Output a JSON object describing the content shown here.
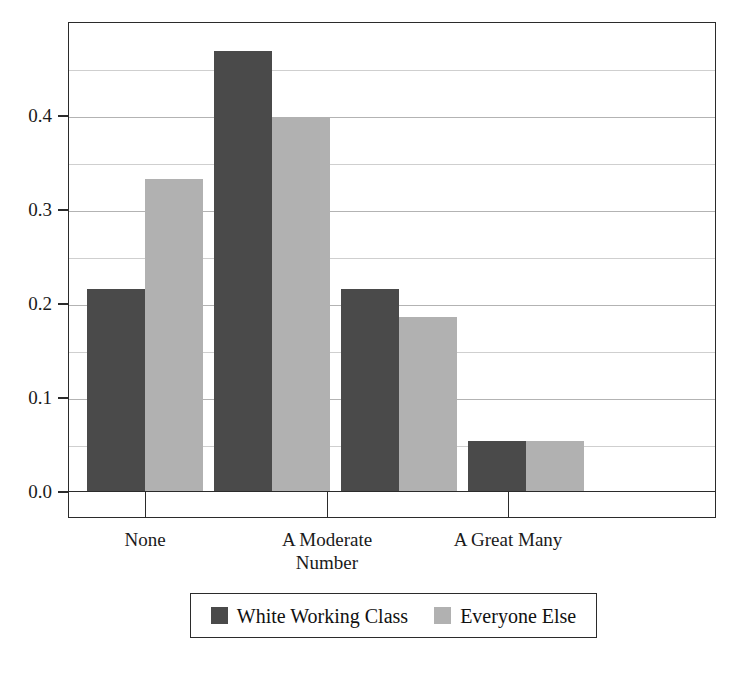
{
  "chart_data": {
    "type": "bar",
    "title": "",
    "subtitle": "",
    "xlabel": "",
    "ylabel": "",
    "categories": [
      "None",
      "",
      "A Moderate\nNumber",
      "A Great Many"
    ],
    "visible_tick_labels": [
      "None",
      "A Moderate\nNumber",
      "A Great Many"
    ],
    "series": [
      {
        "name": "White Working Class",
        "color": "#4a4a4a",
        "values": [
          0.215,
          0.468,
          0.215,
          0.053
        ]
      },
      {
        "name": "Everyone Else",
        "color": "#b1b1b1",
        "values": [
          0.332,
          0.398,
          0.185,
          0.053
        ]
      }
    ],
    "ylim": [
      0.0,
      0.5
    ],
    "yticks": [
      0.0,
      0.1,
      0.2,
      0.3,
      0.4
    ],
    "ytick_labels": [
      "0.0",
      "0.1",
      "0.2",
      "0.3",
      "0.4"
    ],
    "minor_gridlines": [
      0.05,
      0.15,
      0.25,
      0.35,
      0.45
    ],
    "grid": true,
    "grid_axis": "y",
    "legend_position": "bottom",
    "bar_count": 8,
    "bars": [
      {
        "group": "None",
        "series": "White Working Class",
        "value": 0.215
      },
      {
        "group": "None",
        "series": "Everyone Else",
        "value": 0.332
      },
      {
        "group": "",
        "series": "White Working Class",
        "value": 0.468
      },
      {
        "group": "",
        "series": "Everyone Else",
        "value": 0.398
      },
      {
        "group": "A Moderate Number",
        "series": "White Working Class",
        "value": 0.215
      },
      {
        "group": "A Moderate Number",
        "series": "Everyone Else",
        "value": 0.185
      },
      {
        "group": "A Great Many",
        "series": "White Working Class",
        "value": 0.053
      },
      {
        "group": "A Great Many",
        "series": "Everyone Else",
        "value": 0.039
      }
    ]
  },
  "legend": {
    "entries": [
      {
        "label": "White Working Class",
        "color": "#4a4a4a"
      },
      {
        "label": "Everyone Else",
        "color": "#b1b1b1"
      }
    ]
  },
  "colors": {
    "series_dark": "#4a4a4a",
    "series_light": "#b1b1b1",
    "axis": "#2b2b2b",
    "grid": "#9a9a9a",
    "background": "#ffffff",
    "text": "#1a1a1a"
  }
}
